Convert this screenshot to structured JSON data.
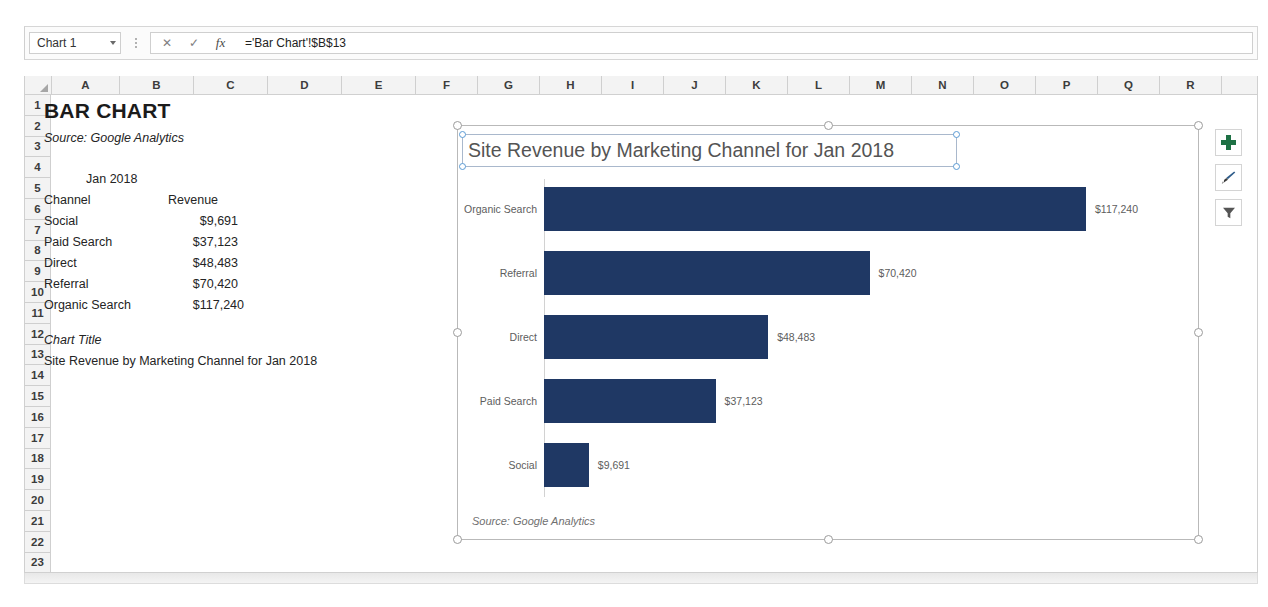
{
  "app": {
    "name_box_value": "Chart 1",
    "formula_value": "='Bar Chart'!$B$13",
    "fx_label": "fx",
    "cancel_glyph": "✕",
    "confirm_glyph": "✓"
  },
  "grid": {
    "columns": [
      "A",
      "B",
      "C",
      "D",
      "E",
      "F",
      "G",
      "H",
      "I",
      "J",
      "K",
      "L",
      "M",
      "N",
      "O",
      "P",
      "Q",
      "R"
    ],
    "rows": [
      "1",
      "2",
      "3",
      "4",
      "5",
      "6",
      "7",
      "8",
      "9",
      "10",
      "11",
      "12",
      "13",
      "14",
      "15",
      "16",
      "17",
      "18",
      "19",
      "20",
      "21",
      "22",
      "23"
    ]
  },
  "sheet": {
    "title": "BAR CHART",
    "source": "Source:  Google Analytics",
    "period_header": "Jan 2018",
    "table_headers": {
      "channel": "Channel",
      "revenue": "Revenue"
    },
    "table_rows": [
      {
        "channel": "Social",
        "revenue": "$9,691"
      },
      {
        "channel": "Paid Search",
        "revenue": "$37,123"
      },
      {
        "channel": "Direct",
        "revenue": "$48,483"
      },
      {
        "channel": "Referral",
        "revenue": "$70,420"
      },
      {
        "channel": "Organic Search",
        "revenue": "$117,240"
      }
    ],
    "chart_title_label": "Chart Title",
    "chart_title_value": "Site Revenue by Marketing Channel for Jan 2018"
  },
  "chart": {
    "title": "Site Revenue by Marketing Channel for Jan 2018",
    "source_note": "Source: Google Analytics",
    "bar_color": "#1f3864",
    "selected": true,
    "buttons": [
      {
        "name": "chart-elements-button",
        "icon": "plus-icon"
      },
      {
        "name": "chart-styles-button",
        "icon": "paintbrush-icon"
      },
      {
        "name": "chart-filters-button",
        "icon": "funnel-icon"
      }
    ]
  },
  "chart_data": {
    "type": "bar",
    "orientation": "horizontal",
    "title": "Site Revenue by Marketing Channel for Jan 2018",
    "xlabel": "",
    "ylabel": "",
    "categories": [
      "Organic Search",
      "Referral",
      "Direct",
      "Paid Search",
      "Social"
    ],
    "values": [
      117240,
      70420,
      48483,
      37123,
      9691
    ],
    "data_labels": [
      "$117,240",
      "$70,420",
      "$48,483",
      "$37,123",
      "$9,691"
    ],
    "series": [
      {
        "name": "Revenue",
        "values": [
          117240,
          70420,
          48483,
          37123,
          9691
        ]
      }
    ],
    "xlim": [
      0,
      117240
    ],
    "grid": false,
    "legend": false,
    "annotation": "Source: Google Analytics",
    "color": "#1f3864"
  }
}
